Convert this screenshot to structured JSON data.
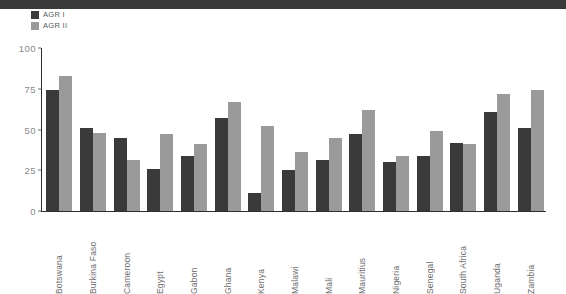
{
  "chart_data": {
    "type": "bar",
    "title": "",
    "subtitle": "",
    "xlabel": "",
    "ylabel": "",
    "ylim": [
      0,
      100
    ],
    "yticks": [
      0,
      25,
      50,
      75,
      100
    ],
    "grid": false,
    "legend_position": "top-left",
    "categories": [
      "Botswana",
      "Burkina Faso",
      "Cameroon",
      "Egypt",
      "Gabon",
      "Ghana",
      "Kenya",
      "Malawi",
      "Mali",
      "Mauritius",
      "Nigeria",
      "Senegal",
      "South Africa",
      "Uganda",
      "Zambia"
    ],
    "series": [
      {
        "name": "AGR I",
        "color": "#3a3a3a",
        "values": [
          74,
          51,
          45,
          26,
          34,
          57,
          11,
          25,
          31,
          47,
          30,
          34,
          42,
          61,
          51
        ]
      },
      {
        "name": "AGR II",
        "color": "#9a9a9a",
        "values": [
          83,
          48,
          31,
          47,
          41,
          67,
          52,
          36,
          45,
          62,
          34,
          49,
          41,
          72,
          74
        ]
      }
    ]
  },
  "legend": {
    "items": [
      {
        "label": "AGR I",
        "color": "#3a3a3a"
      },
      {
        "label": "AGR II",
        "color": "#9a9a9a"
      }
    ]
  },
  "axis": {
    "y_tick_labels": [
      "100",
      "75",
      "50",
      "25",
      "0"
    ]
  },
  "decor": {
    "top_band_color": "#3a3a3a"
  }
}
